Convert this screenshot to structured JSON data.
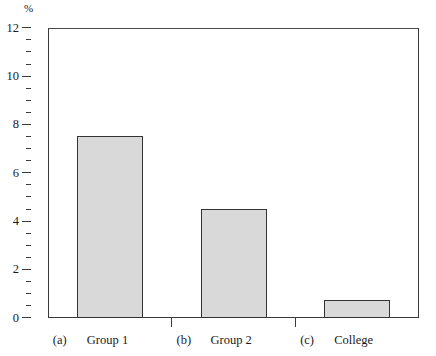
{
  "chart_data": {
    "type": "bar",
    "title": "",
    "subtitle": "",
    "xlabel": "",
    "ylabel": "%",
    "ylim": [
      0,
      12
    ],
    "ytick_step": 2,
    "yminor_step": 0.5,
    "grid": false,
    "legend": null,
    "categories": [
      "Group 1",
      "Group 2",
      "College"
    ],
    "category_enumerators": [
      "(a)",
      "(b)",
      "(c)"
    ],
    "values": [
      7.55,
      4.5,
      0.75
    ],
    "ytick_labels": [
      "0",
      "2",
      "4",
      "6",
      "8",
      "10",
      "12"
    ],
    "ytick_values": [
      0,
      2,
      4,
      6,
      8,
      10,
      12
    ],
    "bar_fill_color": "#d9d9d9",
    "bar_edge_color": "#343434",
    "axis_color": "#3a3a3a",
    "background_color": "#ffffff"
  },
  "axes": {
    "unit_label": "%"
  },
  "bars": [
    {
      "enumerator": "(a)",
      "label": "Group 1",
      "value": 7.55
    },
    {
      "enumerator": "(b)",
      "label": "Group 2",
      "value": 4.5
    },
    {
      "enumerator": "(c)",
      "label": "College",
      "value": 0.75
    }
  ]
}
